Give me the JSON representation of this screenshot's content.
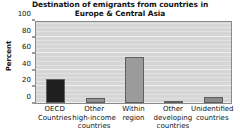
{
  "chart_data": {
    "type": "bar",
    "title": "Destination of emigrants from countries in Europe & Central Asia",
    "title_lines": [
      "Destination of emigrants from countries in",
      "Europe & Central Asia"
    ],
    "xlabel": "",
    "ylabel": "Percent",
    "ylim": [
      0,
      100
    ],
    "yticks": [
      0,
      20,
      40,
      60,
      80,
      100
    ],
    "grid": true,
    "grid_axis": "y",
    "legend": "none",
    "categories": [
      "OECD Countries",
      "Other high-income countries",
      "Within region",
      "Other developing countries",
      "Unidentified countries"
    ],
    "category_lines": [
      [
        "OECD",
        "Countries"
      ],
      [
        "Other",
        "high-income",
        "countries"
      ],
      [
        "Within",
        "region"
      ],
      [
        "Other",
        "developing",
        "countries"
      ],
      [
        "Unidentified",
        "countries"
      ]
    ],
    "values": [
      29,
      6,
      55,
      1,
      7
    ],
    "bar_colors": [
      "#1f1f1f",
      "#8f8f8f",
      "#9b9b9b",
      "#8f8f8f",
      "#8a8a8a"
    ],
    "plot_background": "#d6d6d6",
    "bar_edge_color": "#5f5f5f",
    "axis_color": "#3a3a3a"
  }
}
